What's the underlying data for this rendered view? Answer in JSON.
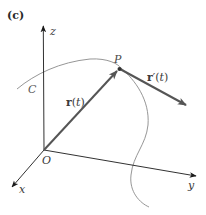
{
  "figure": {
    "panel_label": "(c)",
    "axes": {
      "z_label": "z",
      "x_label": "x",
      "y_label": "y",
      "origin_label": "O"
    },
    "curve_label": "C",
    "point_label": "P",
    "position_vector": {
      "symbol": "r",
      "arg_open": "(",
      "arg": "t",
      "arg_close": ")"
    },
    "tangent_vector": {
      "symbol": "r",
      "prime": "′",
      "arg_open": "(",
      "arg": "t",
      "arg_close": ")"
    },
    "colors": {
      "axis": "#1a1a1a",
      "curve": "#8a8a8a",
      "vector": "#555555",
      "point": "#333333"
    }
  }
}
